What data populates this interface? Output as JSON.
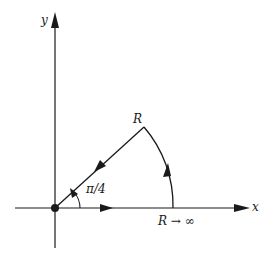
{
  "diagram": {
    "type": "contour-integration-path",
    "colors": {
      "line": "#1a1a1a",
      "background": "#ffffff"
    },
    "axes": {
      "x_label": "x",
      "y_label": "y"
    },
    "labels": {
      "corner_point": "R",
      "arc_end": "R → ∞",
      "angle": "π/4"
    },
    "contour": {
      "segments": [
        {
          "name": "real-axis-segment",
          "from": "0",
          "to": "R",
          "direction": "right"
        },
        {
          "name": "circular-arc",
          "from": "R",
          "to": "R·e^{iπ/4}",
          "direction": "counterclockwise"
        },
        {
          "name": "ray-segment",
          "from": "R·e^{iπ/4}",
          "to": "0",
          "direction": "toward-origin"
        }
      ],
      "origin_marker": "filled-dot"
    }
  }
}
